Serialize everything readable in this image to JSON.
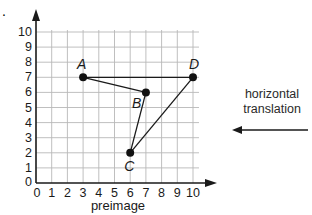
{
  "problem": {
    "marker": "."
  },
  "graph": {
    "caption": "preimage",
    "origin_px": [
      36,
      183
    ],
    "unit_x_px": 15.7,
    "unit_y_px": 15.1,
    "x_ticks": [
      "0",
      "1",
      "2",
      "3",
      "4",
      "5",
      "6",
      "7",
      "8",
      "9",
      "10"
    ],
    "y_ticks": [
      "0",
      "1",
      "2",
      "3",
      "4",
      "5",
      "6",
      "7",
      "8",
      "9",
      "10"
    ],
    "x_range": [
      0,
      10
    ],
    "y_range": [
      0,
      10
    ],
    "grid_color": "#b8b8b8",
    "axis_color": "#1a1a1a"
  },
  "figure": {
    "name": "ABCD",
    "points": [
      {
        "label": "A",
        "x": 3,
        "y": 7,
        "label_dx": -6,
        "label_dy": -8
      },
      {
        "label": "B",
        "x": 7,
        "y": 6,
        "label_dx": -14,
        "label_dy": 16
      },
      {
        "label": "C",
        "x": 6,
        "y": 2,
        "label_dx": -6,
        "label_dy": 18
      },
      {
        "label": "D",
        "x": 10,
        "y": 7,
        "label_dx": -4,
        "label_dy": -8
      }
    ],
    "segments": [
      [
        "A",
        "B"
      ],
      [
        "B",
        "C"
      ],
      [
        "C",
        "D"
      ],
      [
        "D",
        "A"
      ]
    ]
  },
  "annotation": {
    "line1": "horizontal",
    "line2": "translation",
    "arrow_direction": "left"
  }
}
